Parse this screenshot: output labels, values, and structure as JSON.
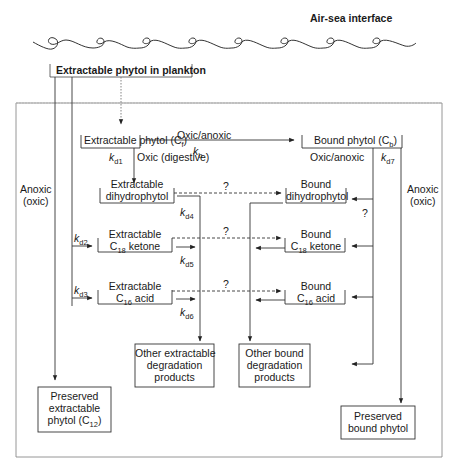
{
  "header": {
    "interface_label": "Air-sea interface"
  },
  "source": {
    "label": "Extractable phytol in plankton"
  },
  "nodes": {
    "extractable_phytol": {
      "text": "Extractable phytol (C",
      "sub": "f",
      "close": ")"
    },
    "bound_phytol": {
      "text": "Bound phytol (C",
      "sub": "b",
      "close": ")"
    },
    "extractable_dihydrophytol": {
      "line1": "Extractable",
      "line2": "dihydrophytol"
    },
    "bound_dihydrophytol": {
      "line1": "Bound",
      "line2": "dihydrophytol"
    },
    "extractable_c18_ketone": {
      "line1": "Extractable",
      "pre": "C",
      "sub": "18",
      "post": " ketone"
    },
    "bound_c18_ketone": {
      "line1": "Bound",
      "pre": "C",
      "sub": "18",
      "post": " ketone"
    },
    "extractable_c16_acid": {
      "line1": "Extractable",
      "pre": "C",
      "sub": "16",
      "post": " acid"
    },
    "bound_c16_acid": {
      "line1": "Bound",
      "pre": "C",
      "sub": "16",
      "post": " acid"
    },
    "other_extractable": {
      "line1": "Other extractable",
      "line2": "degradation",
      "line3": "products"
    },
    "other_bound": {
      "line1": "Other bound",
      "line2": "degradation",
      "line3": "products"
    },
    "preserved_extractable": {
      "line1": "Preserved",
      "line2": "extractable",
      "line3": "phytol (C",
      "sub": "12",
      "close": ")"
    },
    "preserved_bound": {
      "line1": "Preserved",
      "line2": "bound phytol"
    }
  },
  "edge_labels": {
    "oxic_anoxic_top": "Oxic/anoxic",
    "kb": {
      "k": "k",
      "sub": "b"
    },
    "kd1": {
      "k": "k",
      "sub": "d1"
    },
    "oxic_digestive": "Oxic (digestive)",
    "oxic_anoxic_bound": "Oxic/anoxic",
    "kd7": {
      "k": "k",
      "sub": "d7"
    },
    "kd4": {
      "k": "k",
      "sub": "d4"
    },
    "kd2": {
      "k": "k",
      "sub": "d2"
    },
    "kd3": {
      "k": "k",
      "sub": "d3"
    },
    "kd5": {
      "k": "k",
      "sub": "d5"
    },
    "kd6": {
      "k": "k",
      "sub": "d6"
    },
    "q1": "?",
    "q2": "?",
    "q3": "?",
    "q4": "?",
    "anoxic_left": {
      "line1": "Anoxic",
      "line2": "(oxic)"
    },
    "anoxic_right": {
      "line1": "Anoxic",
      "line2": "(oxic)"
    }
  },
  "colors": {
    "line": "#3a3a3a",
    "frame": "#8a8a8a",
    "text": "#1a1a1a"
  }
}
